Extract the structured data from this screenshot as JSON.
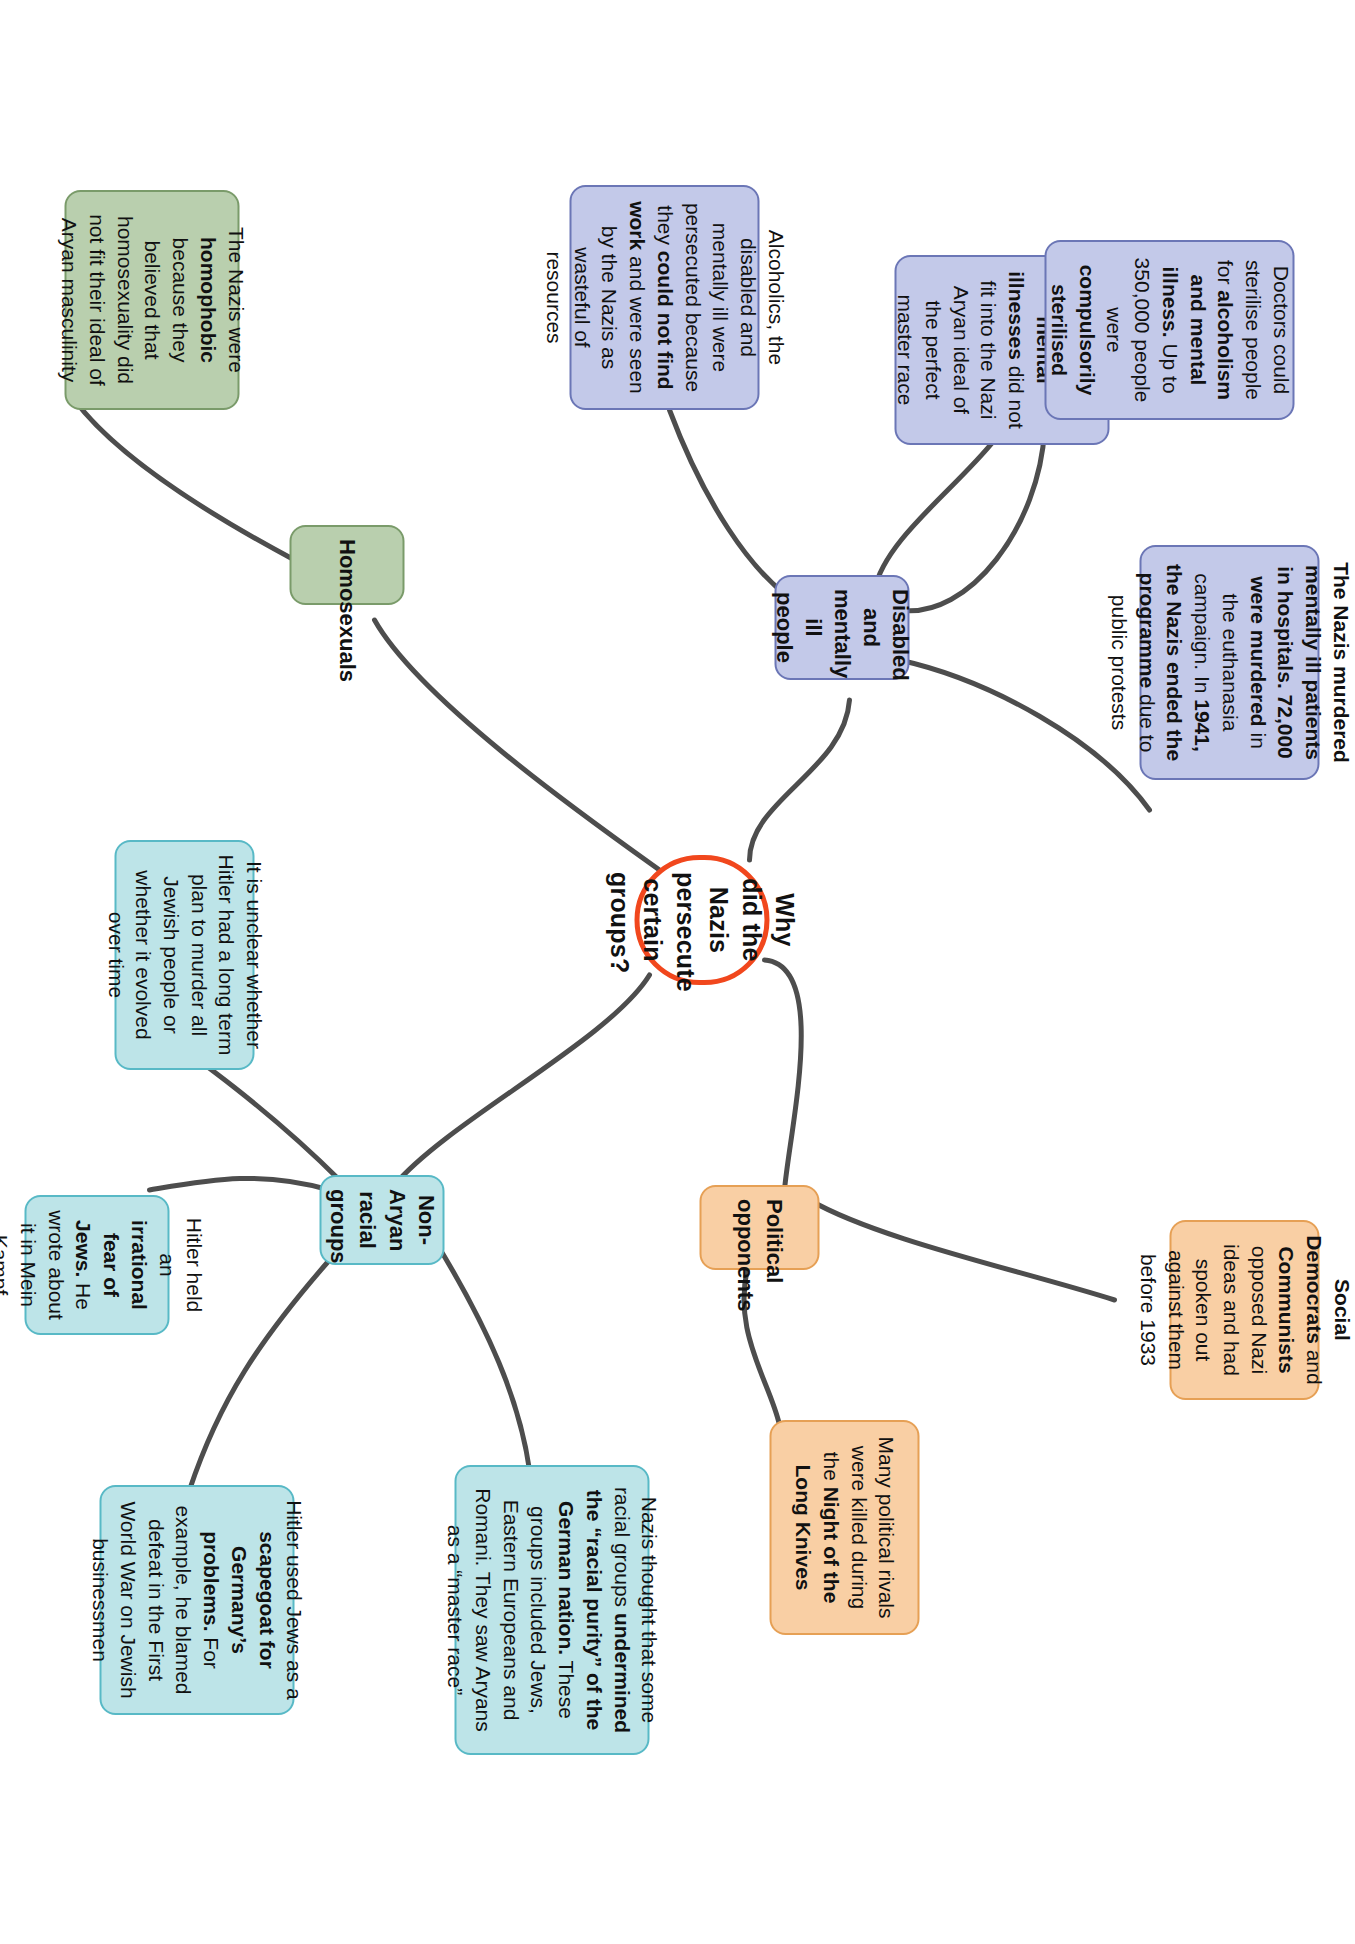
{
  "diagram": {
    "type": "mind-map",
    "title": "Why did the Nazis persecute certain groups?",
    "root": {
      "id": "root",
      "label": "Why did the Nazis persecute certain groups?",
      "color": "#f1471d"
    },
    "branches": [
      {
        "id": "disabled",
        "label": "Disabled and mentally ill people",
        "color": "#c3c9e9",
        "border": "#6b76b6",
        "leaves": [
          {
            "id": "leaf-people-physical",
            "html": "People with <b>physical or mental illnesses</b> did not fit into the Nazi Aryan ideal of the perfect master race",
            "text": "People with physical or mental illnesses did not fit into the Nazi Aryan ideal of the perfect master race"
          },
          {
            "id": "leaf-doctors-sterilise",
            "html": "Doctors could sterilise people for <b>alcoholism and mental illness.</b> Up to 350,000 people were <b>compulsorily sterilised</b>",
            "text": "Doctors could sterilise people for alcoholism and mental illness. Up to 350,000 people were compulsorily sterilised"
          },
          {
            "id": "leaf-euthanasia",
            "html": "<b>The Nazis murdered mentally ill patients in hospitals. 72,000 were murdered</b> in the euthanasia campaign. In <b>1941, the Nazis ended the programme</b> due to public protests",
            "text": "The Nazis murdered mentally ill patients in hospitals. 72,000 were murdered in the euthanasia campaign. In 1941, the Nazis ended the programme due to public protests"
          },
          {
            "id": "leaf-alcoholics",
            "html": "Alcoholics, the disabled and mentally ill were persecuted because they <b>could not find work</b> and were seen by the Nazis as wasteful of resources",
            "text": "Alcoholics, the disabled and mentally ill were persecuted because they could not find work and were seen by the Nazis as wasteful of resources"
          }
        ]
      },
      {
        "id": "political",
        "label": "Political opponents",
        "color": "#f9cfa4",
        "border": "#e6a055",
        "leaves": [
          {
            "id": "leaf-social-democrats",
            "html": "<b>Social Democrats</b> and <b>Communists</b> opposed Nazi ideas and had spoken out against them before 1933",
            "text": "Social Democrats and Communists opposed Nazi ideas and had spoken out against them before 1933"
          },
          {
            "id": "leaf-long-knives",
            "html": "Many political rivals were killed during the <b>Night of the Long Knives</b>",
            "text": "Many political rivals were killed during the Night of the Long Knives"
          }
        ]
      },
      {
        "id": "nonaryan",
        "label": "Non-Aryan racial groups",
        "color": "#bde4e8",
        "border": "#58b9c6",
        "leaves": [
          {
            "id": "leaf-racial-purity",
            "html": "Nazis thought that some racial groups <b>undermined the “racial purity” of the German nation.</b> These groups included Jews, Eastern Europeans and Romani. They saw Aryans as a “master race”",
            "text": "Nazis thought that some racial groups undermined the “racial purity” of the German nation. These groups included Jews, Eastern Europeans and Romani. They saw Aryans as a “master race”"
          },
          {
            "id": "leaf-scapegoat",
            "html": "Hitler used Jews as a <b>scapegoat for Germany’s problems.</b> For example, he blamed defeat in the First World War on Jewish businessmen",
            "text": "Hitler used Jews as a scapegoat for Germany’s problems. For example, he blamed defeat in the First World War on Jewish businessmen"
          },
          {
            "id": "leaf-irrational-fear",
            "html": "Hitler held an <b>irrational fear of Jews.</b> He wrote about it in Mein Kampf",
            "text": "Hitler held an irrational fear of Jews. He wrote about it in Mein Kampf"
          },
          {
            "id": "leaf-unclear-plan",
            "html": "It is unclear whether Hitler had a long term plan to murder all Jewish people or whether it evolved over time",
            "text": "It is unclear whether Hitler had a long term plan to murder all Jewish people or whether it evolved over time"
          }
        ]
      },
      {
        "id": "homosexuals",
        "label": "Homosexuals",
        "color": "#b9cfae",
        "border": "#7a9b6a",
        "leaves": [
          {
            "id": "leaf-homophobic",
            "html": "The Nazis were <b>homophobic</b> because they believed that homosexuality did not fit their ideal of Aryan masculinity",
            "text": "The Nazis were homophobic because they believed that homosexuality did not fit their ideal of Aryan masculinity"
          }
        ]
      }
    ]
  }
}
